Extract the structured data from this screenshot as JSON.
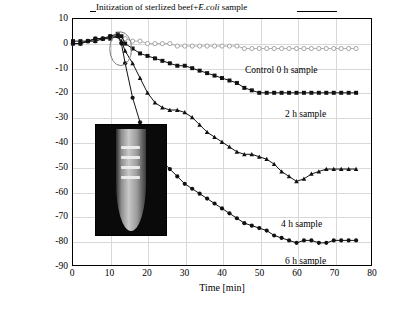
{
  "chart_data": {
    "type": "line",
    "title": "",
    "xlabel": "Time [min]",
    "ylabel": "Resonant frequency change [Hz]",
    "xlim": [
      0,
      80
    ],
    "ylim": [
      -90,
      10
    ],
    "xticks": [
      0,
      10,
      20,
      30,
      40,
      50,
      60,
      70,
      80
    ],
    "yticks": [
      10,
      0,
      -10,
      -20,
      -30,
      -40,
      -50,
      -60,
      -70,
      -80,
      -90
    ],
    "grid": true,
    "legend_position": "inline-annotations",
    "annotations": [
      {
        "text": "Initization of sterlized beef+E.coli sample",
        "x": 14,
        "y": 9
      }
    ],
    "series": [
      {
        "name": "Control 0 h sample",
        "marker": "open-circle",
        "color": "#9a9a9a",
        "x": [
          0,
          2,
          4,
          6,
          8,
          10,
          12,
          14,
          16,
          18,
          20,
          22,
          24,
          26,
          28,
          30,
          32,
          34,
          36,
          38,
          40,
          42,
          44,
          46,
          48,
          50,
          52,
          54,
          56,
          58,
          60,
          62,
          64,
          66,
          68,
          70,
          72,
          74,
          76
        ],
        "y": [
          0,
          0,
          1,
          1,
          2,
          2,
          3,
          2,
          1,
          1,
          0,
          0,
          0,
          0,
          -1,
          -1,
          -1,
          -1,
          -1,
          -1,
          -1,
          -1,
          -1,
          -2,
          -2,
          -2,
          -2,
          -2,
          -2,
          -2,
          -2,
          -2,
          -2,
          -2,
          -2,
          -2,
          -2,
          -2,
          -2
        ]
      },
      {
        "name": "2 h sample",
        "marker": "filled-square",
        "color": "#111111",
        "x": [
          0,
          2,
          4,
          6,
          8,
          10,
          12,
          13,
          14,
          16,
          18,
          20,
          22,
          24,
          26,
          28,
          30,
          32,
          34,
          36,
          38,
          40,
          42,
          44,
          46,
          48,
          50,
          52,
          54,
          56,
          58,
          60,
          62,
          64,
          66,
          68,
          70,
          72,
          74,
          76
        ],
        "y": [
          1,
          1,
          1,
          2,
          2,
          3,
          4,
          3,
          0,
          -2,
          -4,
          -5,
          -6,
          -7,
          -8,
          -9,
          -9,
          -10,
          -11,
          -12,
          -13,
          -14,
          -15,
          -16,
          -18,
          -19,
          -20,
          -20,
          -20,
          -20,
          -20,
          -20,
          -20,
          -20,
          -20,
          -20,
          -20,
          -20,
          -20,
          -20
        ]
      },
      {
        "name": "4 h sample",
        "marker": "filled-triangle",
        "color": "#111111",
        "x": [
          0,
          2,
          4,
          6,
          8,
          10,
          12,
          13,
          14,
          16,
          18,
          20,
          22,
          24,
          26,
          28,
          30,
          32,
          34,
          36,
          38,
          40,
          42,
          44,
          46,
          48,
          50,
          52,
          54,
          56,
          58,
          60,
          62,
          64,
          66,
          68,
          70,
          72,
          74,
          76
        ],
        "y": [
          0,
          0,
          1,
          1,
          2,
          2,
          3,
          1,
          -3,
          -8,
          -14,
          -20,
          -24,
          -26,
          -27,
          -27,
          -28,
          -30,
          -33,
          -36,
          -38,
          -40,
          -42,
          -44,
          -45,
          -45,
          -46,
          -47,
          -49,
          -52,
          -54,
          -56,
          -55,
          -53,
          -52,
          -51,
          -51,
          -51,
          -51,
          -51
        ]
      },
      {
        "name": "6 h sample",
        "marker": "filled-circle",
        "color": "#111111",
        "x": [
          0,
          2,
          4,
          6,
          8,
          10,
          12,
          13,
          14,
          16,
          18,
          20,
          22,
          24,
          26,
          28,
          30,
          32,
          34,
          36,
          38,
          40,
          42,
          44,
          46,
          48,
          50,
          52,
          54,
          56,
          58,
          60,
          62,
          64,
          66,
          68,
          70,
          72,
          74,
          76
        ],
        "y": [
          0,
          0,
          1,
          2,
          2,
          3,
          3,
          0,
          -8,
          -22,
          -32,
          -40,
          -45,
          -48,
          -51,
          -54,
          -57,
          -59,
          -61,
          -63,
          -65,
          -67,
          -69,
          -71,
          -73,
          -74,
          -75,
          -76,
          -78,
          -79,
          -80,
          -81,
          -80,
          -80,
          -81,
          -81,
          -80,
          -80,
          -80,
          -80
        ]
      }
    ],
    "series_labels": [
      {
        "text": "Control 0 h sample",
        "x": 46,
        "y": 5
      },
      {
        "text": "2 h sample",
        "x": 56,
        "y": -13
      },
      {
        "text": "4 h sample",
        "x": 55,
        "y": -57
      },
      {
        "text": "6 h sample",
        "x": 56,
        "y": -74
      }
    ],
    "inset_image": {
      "name": "test-tube-photo",
      "bands": 4
    }
  },
  "axis": {
    "x_tick_labels": [
      "0",
      "10",
      "20",
      "30",
      "40",
      "50",
      "60",
      "70",
      "80"
    ],
    "y_tick_labels": [
      "10",
      "0",
      "-10",
      "-20",
      "-30",
      "-40",
      "-50",
      "-60",
      "-70",
      "-80",
      "-90"
    ],
    "x_title": "Time [min]",
    "y_title": "Resonant frequency change [Hz]"
  },
  "annotation": {
    "init_text_1": "Initization of sterlized beef+",
    "init_text_2": "E.coli",
    "init_text_3": " sample"
  }
}
